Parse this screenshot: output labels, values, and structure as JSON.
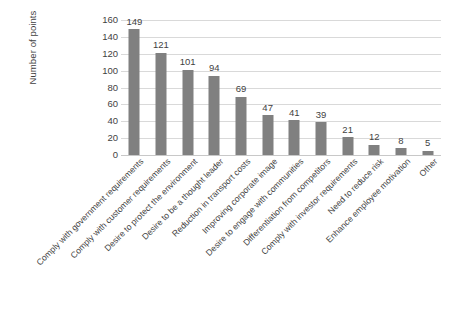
{
  "chart_data": {
    "type": "bar",
    "title": "",
    "xlabel": "",
    "ylabel": "Number of points",
    "ylim": [
      0,
      160
    ],
    "ytick_step": 20,
    "yticks": [
      160,
      140,
      120,
      100,
      80,
      60,
      40,
      20,
      0
    ],
    "grid": true,
    "legend": false,
    "orientation": "vertical",
    "bar_color": "#808080",
    "gridline_color": "#d9d9d9",
    "categories": [
      "Comply with government requirements",
      "Comply with customer requirements",
      "Desire to protect the environment",
      "Desire to be a thought leader",
      "Reduction in transport costs",
      "Improving corporate image",
      "Desire to engage with communities",
      "Differentiation from competitors",
      "Comply with investor requirements",
      "Need to reduce risk",
      "Enhance employee motivation",
      "Other"
    ],
    "values": [
      149,
      121,
      101,
      94,
      69,
      47,
      41,
      39,
      21,
      12,
      8,
      5
    ],
    "data_labels": [
      "149",
      "121",
      "101",
      "94",
      "69",
      "47",
      "41",
      "39",
      "21",
      "12",
      "8",
      "5"
    ]
  }
}
